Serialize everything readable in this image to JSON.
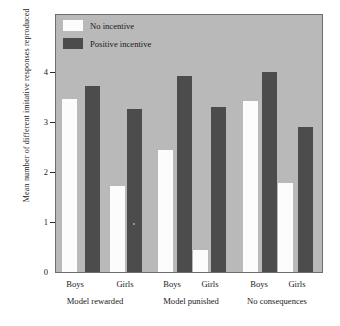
{
  "chart_data": {
    "type": "bar",
    "title": "",
    "xlabel": "",
    "ylabel": "Mean number of different imitative responses reproduced",
    "ylim": [
      0,
      4.6
    ],
    "yticks": [
      0,
      1,
      2,
      3,
      4
    ],
    "ytick_labels": [
      "0",
      "1",
      "2",
      "3",
      "4"
    ],
    "grid": false,
    "legend_position": "top-left",
    "categories": [
      "Boys",
      "Girls",
      "Boys",
      "Girls",
      "Boys",
      "Girls"
    ],
    "groups": [
      {
        "label": "Model rewarded",
        "subcategories": [
          "Boys",
          "Girls"
        ]
      },
      {
        "label": "Model punished",
        "subcategories": [
          "Boys",
          "Girls"
        ]
      },
      {
        "label": "No consequences",
        "subcategories": [
          "Boys",
          "Girls"
        ]
      }
    ],
    "series": [
      {
        "name": "No incentive",
        "color": "#fcfcfc",
        "values": [
          3.47,
          1.73,
          2.44,
          0.45,
          3.43,
          1.78
        ]
      },
      {
        "name": "Positive incentive",
        "color": "#4c4c4c",
        "values": [
          3.72,
          3.27,
          3.93,
          3.3,
          4.0,
          2.9
        ]
      }
    ],
    "plot_background": "#b9b9b9",
    "axis_color": "#2b2b2b"
  },
  "legend": {
    "items": [
      {
        "label": "No incentive",
        "swatch": "light"
      },
      {
        "label": "Positive incentive",
        "swatch": "dark"
      }
    ]
  },
  "axis": {
    "y_title": "Mean number of different imitative responses reproduced",
    "y_ticks": [
      "4",
      "3",
      "2",
      "1",
      "0"
    ]
  },
  "x_axis": {
    "sub_labels": [
      "Boys",
      "Girls",
      "Boys",
      "Girls",
      "Boys",
      "Girls"
    ],
    "group_labels": [
      "Model rewarded",
      "Model punished",
      "No consequences"
    ]
  }
}
